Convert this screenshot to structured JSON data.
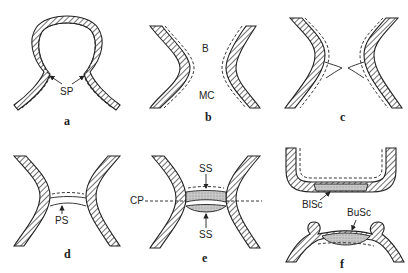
{
  "figure": {
    "panels": [
      {
        "id": "a",
        "label": "a",
        "annotations": [
          "SP"
        ]
      },
      {
        "id": "b",
        "label": "b",
        "annotations": [
          "B",
          "MC"
        ]
      },
      {
        "id": "c",
        "label": "c",
        "annotations": []
      },
      {
        "id": "d",
        "label": "d",
        "annotations": [
          "PS"
        ]
      },
      {
        "id": "e",
        "label": "e",
        "annotations": [
          "SS",
          "CP",
          "SS"
        ]
      },
      {
        "id": "f",
        "label": "f",
        "annotations": [
          "BlSc",
          "BuSc"
        ]
      }
    ],
    "labels": {
      "a_sp": "SP",
      "b_b": "B",
      "b_mc": "MC",
      "d_ps": "PS",
      "e_ss_top": "SS",
      "e_cp": "CP",
      "e_ss_bottom": "SS",
      "f_blsc": "BlSc",
      "f_busc": "BuSc"
    },
    "colors": {
      "ink": "#222222",
      "background": "#ffffff",
      "shade": "#bdbdbd"
    }
  }
}
